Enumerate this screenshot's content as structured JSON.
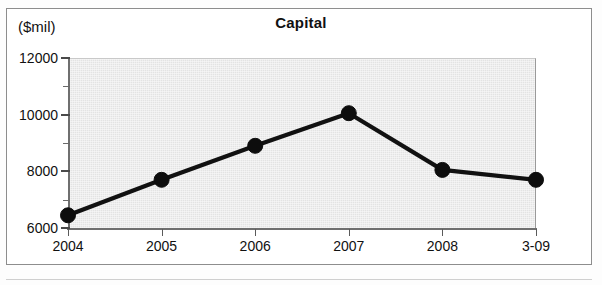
{
  "chart_data": {
    "type": "line",
    "title": "Capital",
    "ylabel": "($mil)",
    "xlabel": "",
    "categories": [
      "2004",
      "2005",
      "2006",
      "2007",
      "2008",
      "3-09"
    ],
    "values": [
      6450,
      7700,
      8900,
      10050,
      8050,
      7700
    ],
    "series": [
      {
        "name": "Capital",
        "values": [
          6450,
          7700,
          8900,
          10050,
          8050,
          7700
        ]
      }
    ],
    "ylim": [
      6000,
      12000
    ],
    "y_major_ticks": [
      6000,
      8000,
      10000,
      12000
    ],
    "y_minor_ticks": [
      7000,
      9000,
      11000
    ],
    "y_tick_labels": [
      "6000",
      "8000",
      "10000",
      "12000"
    ],
    "grid": false,
    "legend": "none",
    "marker": "circle",
    "line_color": "#111111",
    "plot_background": "#e3e3e3"
  },
  "figure": {
    "title": "Capital",
    "units_label": "($mil)"
  }
}
